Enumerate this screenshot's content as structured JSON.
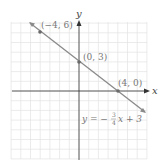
{
  "chart_data": {
    "type": "line",
    "title": "",
    "xlabel": "x",
    "ylabel": "y",
    "xlim": [
      -7,
      7
    ],
    "ylim": [
      -7,
      7
    ],
    "grid": true,
    "series": [
      {
        "name": "y = -3/4 x + 3",
        "x": [
          -5,
          8.3
        ],
        "y": [
          6.75,
          -3.2
        ]
      }
    ],
    "points": [
      {
        "label": "(−4, 6)",
        "x": -4,
        "y": 6
      },
      {
        "label": "(0, 3)",
        "x": 0,
        "y": 3
      },
      {
        "label": "(4, 0)",
        "x": 4,
        "y": 0
      }
    ],
    "equation_label": "y = −3/4 x + 3"
  },
  "labels": {
    "x_axis": "x",
    "y_axis": "y",
    "p1": "(−4, 6)",
    "p2": "(0, 3)",
    "p3": "(4, 0)",
    "eq_prefix": "y = −",
    "eq_num": "3",
    "eq_den": "4",
    "eq_suffix": "x + 3"
  },
  "colors": {
    "grid": "#e3e3e3",
    "axis": "#333333",
    "line": "#8a8a8a",
    "point": "#6a6a6a",
    "label": "#777777"
  }
}
